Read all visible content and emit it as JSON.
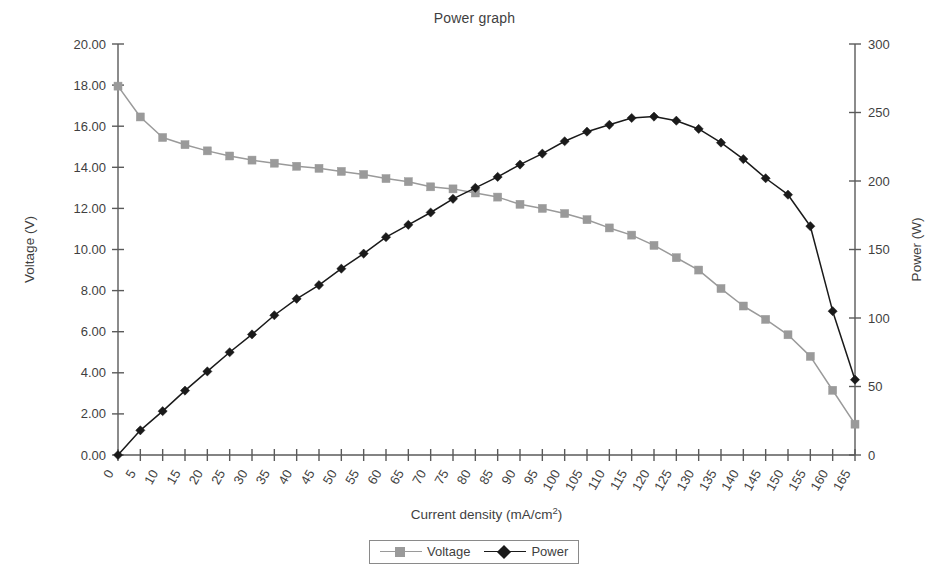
{
  "chart_data": {
    "type": "line",
    "title": "Power graph",
    "xlabel": "Current density (mA/cm",
    "xlabel_sup": "2",
    "xlabel_tail": ")",
    "xlabel_full": "Current density (mA/cm2)",
    "ylabel": "Voltage (V)",
    "y2label": "Power (W)",
    "grid": false,
    "legend_position": "bottom-center",
    "x": [
      0,
      5,
      10,
      15,
      20,
      25,
      30,
      35,
      40,
      45,
      50,
      55,
      60,
      65,
      70,
      75,
      80,
      85,
      90,
      95,
      100,
      105,
      110,
      115,
      120,
      125,
      130,
      135,
      140,
      145,
      150,
      155,
      160,
      165
    ],
    "xlim": [
      0,
      165
    ],
    "xticks": [
      "0",
      "5",
      "10",
      "15",
      "20",
      "25",
      "30",
      "35",
      "40",
      "45",
      "50",
      "55",
      "60",
      "65",
      "70",
      "75",
      "80",
      "85",
      "90",
      "95",
      "100",
      "105",
      "110",
      "115",
      "120",
      "125",
      "130",
      "135",
      "140",
      "145",
      "150",
      "155",
      "160",
      "165"
    ],
    "ylim": [
      0.0,
      20.0
    ],
    "yticks": [
      "0.00",
      "2.00",
      "4.00",
      "6.00",
      "8.00",
      "10.00",
      "12.00",
      "14.00",
      "16.00",
      "18.00",
      "20.00"
    ],
    "ytick_values": [
      0,
      2,
      4,
      6,
      8,
      10,
      12,
      14,
      16,
      18,
      20
    ],
    "y2lim": [
      0,
      300
    ],
    "y2ticks": [
      "0",
      "50",
      "100",
      "150",
      "200",
      "250",
      "300"
    ],
    "y2tick_values": [
      0,
      50,
      100,
      150,
      200,
      250,
      300
    ],
    "series": [
      {
        "name": "Voltage",
        "axis": "left",
        "color": "#9a9a9a",
        "marker": "square",
        "values": [
          17.95,
          16.45,
          15.45,
          15.1,
          14.8,
          14.55,
          14.35,
          14.2,
          14.05,
          13.95,
          13.8,
          13.65,
          13.45,
          13.3,
          13.05,
          12.95,
          12.75,
          12.55,
          12.2,
          12.0,
          11.75,
          11.45,
          11.05,
          10.7,
          10.2,
          9.6,
          9.0,
          8.1,
          7.25,
          6.6,
          5.85,
          4.8,
          3.15,
          1.5
        ]
      },
      {
        "name": "Power",
        "axis": "right",
        "color": "#1a1a1a",
        "marker": "diamond",
        "values": [
          0,
          18,
          32,
          47,
          61,
          75,
          88,
          102,
          114,
          124,
          136,
          147,
          159,
          168,
          177,
          187,
          195,
          203,
          212,
          220,
          229,
          236,
          241,
          246,
          247,
          244,
          238,
          228,
          216,
          202,
          190,
          167,
          105,
          55
        ]
      }
    ]
  },
  "legend": {
    "items": [
      {
        "label": "Voltage",
        "color": "#9a9a9a",
        "marker": "square"
      },
      {
        "label": "Power",
        "color": "#1a1a1a",
        "marker": "diamond"
      }
    ]
  },
  "axis_colors": {
    "axis_line": "#5a5a5a",
    "text": "#3f3f3f"
  }
}
